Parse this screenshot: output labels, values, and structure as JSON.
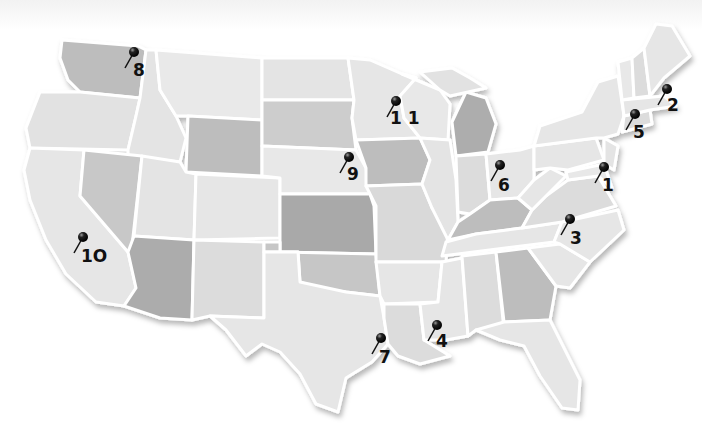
{
  "map": {
    "type": "US states map (grayscale, embossed)",
    "pins": [
      {
        "id": "1",
        "label": "1",
        "x": 604,
        "y": 167,
        "region": "Mid-Atlantic (Virginia/Maryland)"
      },
      {
        "id": "2",
        "label": "2",
        "x": 667,
        "y": 89,
        "region": "New England (Massachusetts)"
      },
      {
        "id": "3",
        "label": "3",
        "x": 570,
        "y": 219,
        "region": "North Carolina"
      },
      {
        "id": "4",
        "label": "4",
        "x": 437,
        "y": 325,
        "region": "Louisiana / Mississippi"
      },
      {
        "id": "5",
        "label": "5",
        "x": 635,
        "y": 114,
        "region": "New York / Connecticut"
      },
      {
        "id": "6",
        "label": "6",
        "x": 500,
        "y": 165,
        "region": "Indiana / Ohio"
      },
      {
        "id": "7",
        "label": "7",
        "x": 381,
        "y": 338,
        "region": "Texas (Houston)"
      },
      {
        "id": "8",
        "label": "8",
        "x": 134,
        "y": 52,
        "region": "Washington"
      },
      {
        "id": "9",
        "label": "9",
        "x": 349,
        "y": 157,
        "region": "Nebraska / Iowa"
      },
      {
        "id": "10",
        "label": "1O",
        "x": 83,
        "y": 237,
        "region": "California"
      },
      {
        "id": "11",
        "label": "1 1",
        "x": 396,
        "y": 101,
        "region": "Minnesota / Wisconsin"
      }
    ],
    "colors": {
      "light": "#e6e6e6",
      "medium": "#d3d3d3",
      "dark": "#bdbdbd",
      "darker": "#a8a8a8",
      "border": "#ffffff",
      "pin": "#111111"
    }
  }
}
